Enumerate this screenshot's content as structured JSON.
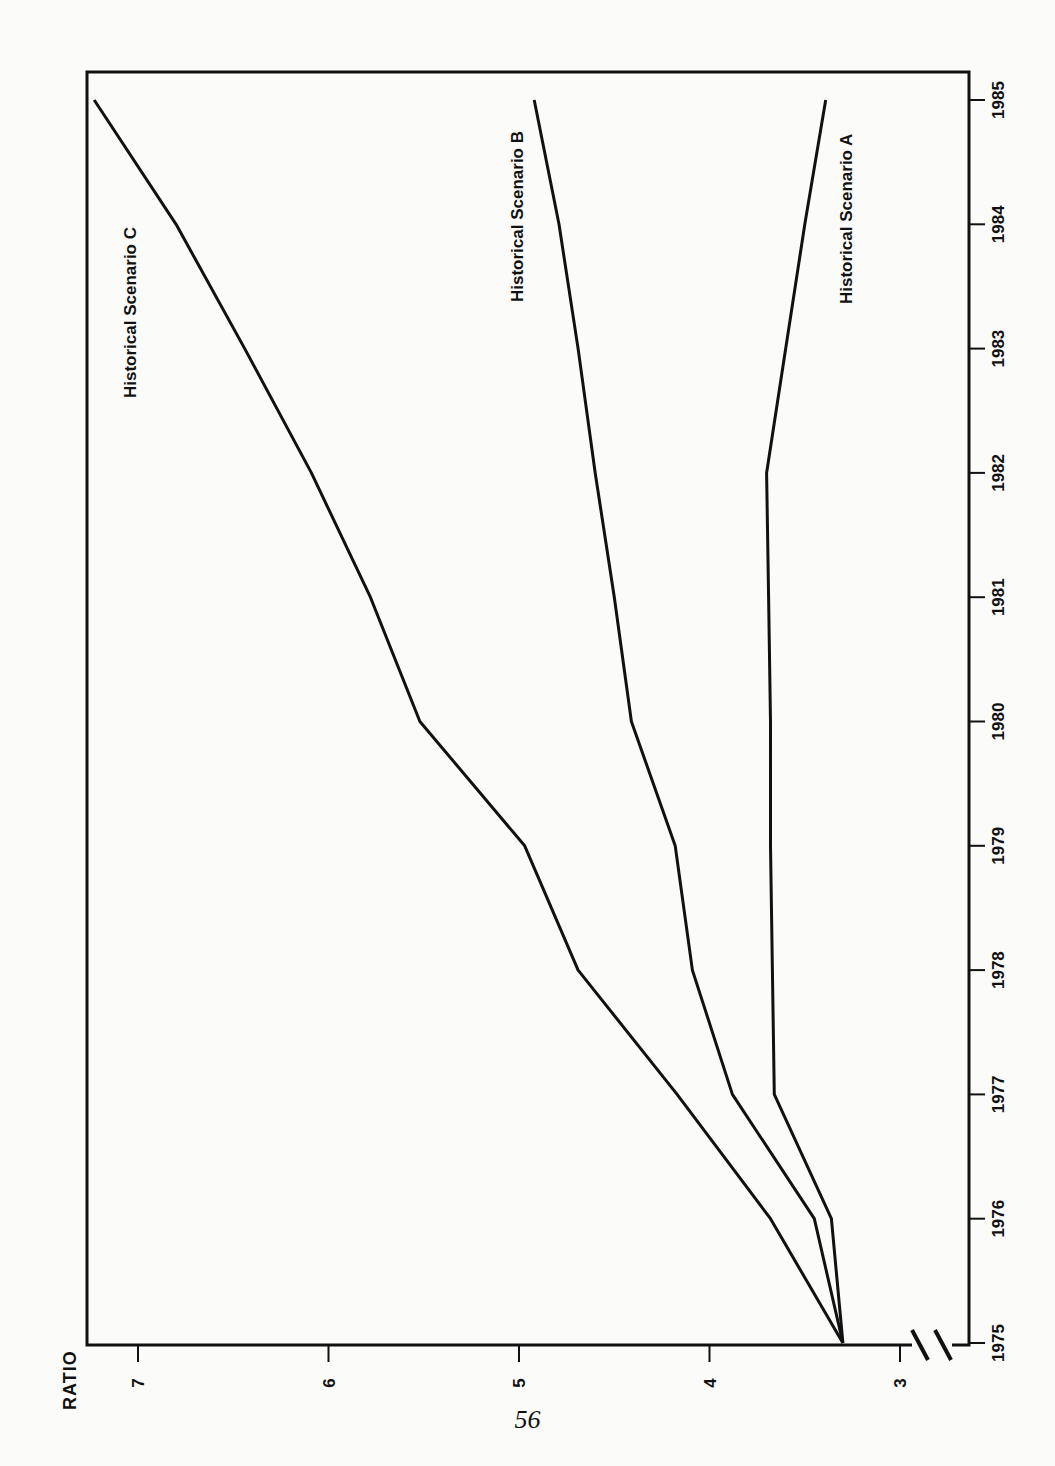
{
  "page": {
    "number": "56",
    "orientation": "rotated 90° counter-clockwise"
  },
  "chart_data": {
    "type": "line",
    "title": "",
    "xlabel": "",
    "ylabel": "RATIO",
    "x": [
      1975,
      1976,
      1977,
      1978,
      1979,
      1980,
      1981,
      1982,
      1983,
      1984,
      1985
    ],
    "xticks": [
      "1975",
      "1976",
      "1977",
      "1978",
      "1979",
      "1980",
      "1981",
      "1982",
      "1983",
      "1984",
      "1985"
    ],
    "yticks": [
      "3",
      "4",
      "5",
      "6",
      "7"
    ],
    "ylim": [
      2.8,
      7.3
    ],
    "xlim": [
      1975,
      1985.2
    ],
    "axis_break": "y-axis broken between 0 and 3",
    "grid": false,
    "legend": "inline labels at line ends",
    "series": [
      {
        "name": "Historical Scenario A",
        "values": [
          3.3,
          3.36,
          3.66,
          3.67,
          3.68,
          3.68,
          3.69,
          3.7,
          3.6,
          3.5,
          3.39
        ]
      },
      {
        "name": "Historical Scenario B",
        "values": [
          3.3,
          3.45,
          3.88,
          4.09,
          4.18,
          4.41,
          4.5,
          4.6,
          4.69,
          4.79,
          4.92
        ]
      },
      {
        "name": "Historical Scenario C",
        "values": [
          3.3,
          3.68,
          4.17,
          4.69,
          4.97,
          5.52,
          5.78,
          6.09,
          6.44,
          6.8,
          7.23
        ]
      }
    ]
  },
  "labels": {
    "axis_title": "RATIO",
    "scenario_a": "Historical Scenario A",
    "scenario_b": "Historical Scenario B",
    "scenario_c": "Historical Scenario C"
  },
  "colors": {
    "line": "#111111",
    "background": "#fbfbfa"
  }
}
